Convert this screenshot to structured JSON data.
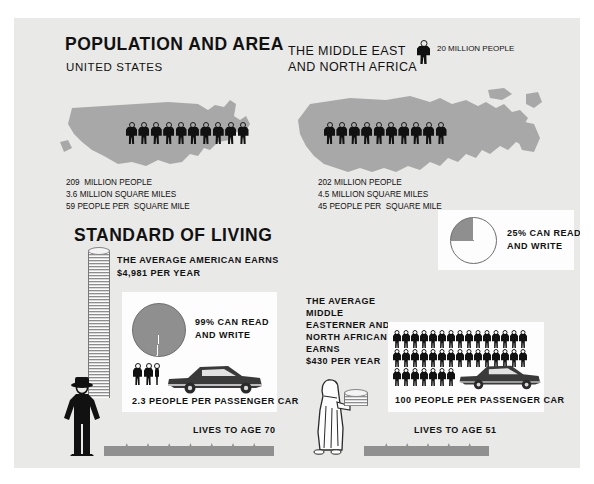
{
  "poster": {
    "background_color": "#e9e9e7",
    "page_background": "#ffffff"
  },
  "sections": {
    "population_and_area": {
      "title": "POPULATION AND AREA",
      "left": {
        "subtitle": "UNITED STATES",
        "icon_name": "us-map",
        "people_icons": 10,
        "stats": [
          "209  MILLION PEOPLE",
          "3.6 MILLION SQUARE MILES",
          "59 PEOPLE PER  SQUARE MILE"
        ]
      },
      "right": {
        "subtitle_line1": "THE MIDDLE EAST",
        "subtitle_line2": "AND NORTH AFRICA",
        "icon_name": "middle-east-north-africa-map",
        "people_icons": 10,
        "stats": [
          "202 MILLION PEOPLE",
          "4.5 MILLION SQUARE MILES",
          "45 PEOPLE PER  SQUARE MILE"
        ]
      },
      "legend": {
        "icon_name": "person-icon",
        "label": "20 MILLION PEOPLE"
      }
    },
    "standard_of_living": {
      "title": "STANDARD OF LIVING",
      "us": {
        "income_label_line1": "THE AVERAGE AMERICAN EARNS",
        "income_label_line2": "$4,981 PER YEAR",
        "coin_stack_name": "tall-coin-stack",
        "literacy": {
          "percent_label_line1": "99% CAN READ",
          "percent_label_line2": "AND WRITE",
          "value": 99
        },
        "cars": {
          "label": "2.3 PEOPLE PER PASSENGER CAR",
          "people_icons": 2,
          "car_icon_name": "sedan-car-icon"
        },
        "lifespan": {
          "label": "LIVES TO AGE 70",
          "age": 70,
          "notches": 7
        }
      },
      "mena": {
        "income_label_lines": [
          "THE AVERAGE",
          "MIDDLE",
          "EASTERNER AND",
          "NORTH AFRICAN",
          "EARNS",
          "$430 PER YEAR"
        ],
        "coin_stack_name": "short-coin-stack",
        "literacy": {
          "percent_label_line1": "25% CAN READ",
          "percent_label_line2": "AND WRITE",
          "value": 25
        },
        "cars": {
          "label": "100 PEOPLE PER PASSENGER CAR",
          "people_icons": 100,
          "car_icon_name": "sedan-car-icon"
        },
        "lifespan": {
          "label": "LIVES TO AGE 51",
          "age": 51,
          "notches": 5
        }
      }
    }
  },
  "chart_data": [
    {
      "type": "pie",
      "title": "99% CAN READ AND WRITE",
      "labels": [
        "Can read and write",
        "Cannot"
      ],
      "values": [
        99,
        1
      ],
      "colors": [
        "#8f8f8f",
        "#fdfdfd"
      ],
      "legend": "right"
    },
    {
      "type": "pie",
      "title": "25% CAN READ AND WRITE",
      "labels": [
        "Can read and write",
        "Cannot"
      ],
      "values": [
        25,
        75
      ],
      "colors": [
        "#8f8f8f",
        "#fdfdfd"
      ],
      "legend": "right"
    },
    {
      "type": "bar",
      "title": "Population (millions)",
      "categories": [
        "United States",
        "Middle East and North Africa"
      ],
      "values": [
        209,
        202
      ],
      "ylabel": "Million people",
      "unit_icon_value": 20
    },
    {
      "type": "bar",
      "title": "Area (million square miles)",
      "categories": [
        "United States",
        "Middle East and North Africa"
      ],
      "values": [
        3.6,
        4.5
      ],
      "ylabel": "Million square miles"
    },
    {
      "type": "bar",
      "title": "Density (people per square mile)",
      "categories": [
        "United States",
        "Middle East and North Africa"
      ],
      "values": [
        59,
        45
      ],
      "ylabel": "People per square mile"
    },
    {
      "type": "bar",
      "title": "Average annual earnings (US$)",
      "categories": [
        "United States",
        "Middle East and North Africa"
      ],
      "values": [
        4981,
        430
      ],
      "ylabel": "US dollars per year"
    },
    {
      "type": "bar",
      "title": "People per passenger car",
      "categories": [
        "United States",
        "Middle East and North Africa"
      ],
      "values": [
        2.3,
        100
      ],
      "ylabel": "People per car"
    },
    {
      "type": "bar",
      "title": "Life expectancy (years)",
      "categories": [
        "United States",
        "Middle East and North Africa"
      ],
      "values": [
        70,
        51
      ],
      "ylabel": "Years"
    }
  ]
}
